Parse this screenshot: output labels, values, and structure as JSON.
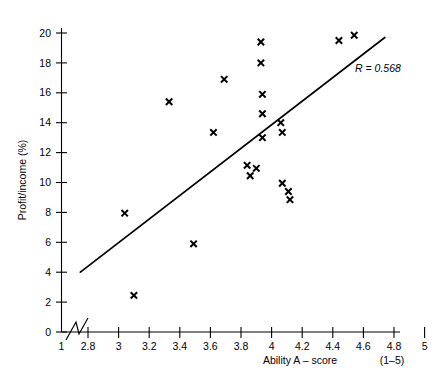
{
  "chart_data": {
    "type": "scatter",
    "title": "",
    "xlabel": "Ability A – score",
    "xlabel_suffix": "(1–5)",
    "ylabel": "Profit/income (%)",
    "xlim": [
      2.7,
      5.0
    ],
    "ylim": [
      0,
      21
    ],
    "x_ticks": [
      "1",
      "2.8",
      "3",
      "3.2",
      "3.4",
      "3.6",
      "3.8",
      "4",
      "4.2",
      "4.4",
      "4.6",
      "4.8",
      "5"
    ],
    "y_ticks": [
      "0",
      "2",
      "4",
      "6",
      "8",
      "10",
      "12",
      "14",
      "16",
      "18",
      "20"
    ],
    "grid": false,
    "legend": "none",
    "axis_break": true,
    "annotations": [
      {
        "name": "correlation-label",
        "text": "R = 0.568",
        "x": 4.62,
        "y": 17.6
      }
    ],
    "trendline": {
      "name": "regression-line",
      "x0": 2.75,
      "y0": 4.0,
      "x1": 4.74,
      "y1": 19.7,
      "r": 0.568
    },
    "points": [
      {
        "x": 3.04,
        "y": 7.95
      },
      {
        "x": 3.1,
        "y": 2.45
      },
      {
        "x": 3.33,
        "y": 15.4
      },
      {
        "x": 3.49,
        "y": 5.9
      },
      {
        "x": 3.62,
        "y": 13.35
      },
      {
        "x": 3.69,
        "y": 16.9
      },
      {
        "x": 3.84,
        "y": 11.15
      },
      {
        "x": 3.86,
        "y": 10.45
      },
      {
        "x": 3.9,
        "y": 10.95
      },
      {
        "x": 3.93,
        "y": 19.4
      },
      {
        "x": 3.93,
        "y": 18.0
      },
      {
        "x": 3.94,
        "y": 15.9
      },
      {
        "x": 3.94,
        "y": 14.6
      },
      {
        "x": 3.94,
        "y": 13.0
      },
      {
        "x": 4.06,
        "y": 14.0
      },
      {
        "x": 4.07,
        "y": 13.35
      },
      {
        "x": 4.07,
        "y": 9.95
      },
      {
        "x": 4.11,
        "y": 9.4
      },
      {
        "x": 4.12,
        "y": 8.85
      },
      {
        "x": 4.44,
        "y": 19.5
      },
      {
        "x": 4.54,
        "y": 19.85
      }
    ],
    "colors": {
      "marker": "#000000",
      "line": "#000000",
      "axis": "#000000",
      "background": "#ffffff"
    }
  }
}
